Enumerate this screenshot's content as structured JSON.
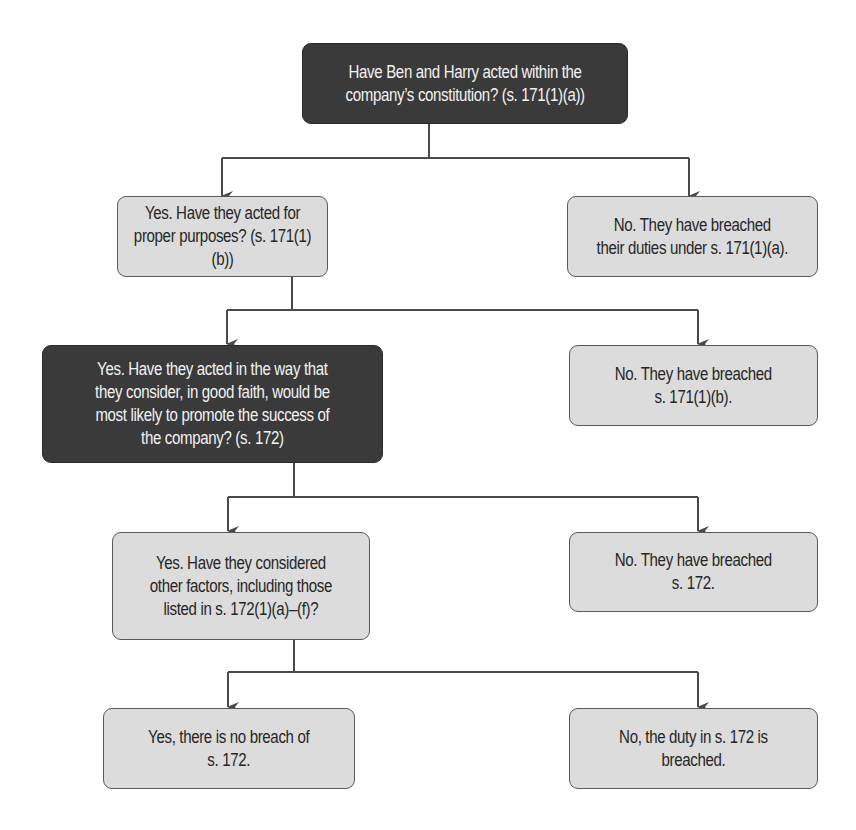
{
  "diagram": {
    "type": "flowchart",
    "line_color": "#4a4a4a",
    "dark_box_color": "#3a3a3a",
    "light_box_color": "#dcdcdc",
    "nodes": {
      "q1": {
        "text": "Have Ben and Harry acted within the\ncompany’s constitution? (s. 171(1)(a))",
        "style": "dark"
      },
      "q1_no": {
        "text": "No. They have breached\ntheir duties under s. 171(1)(a).",
        "style": "light"
      },
      "q2": {
        "text": "Yes. Have they acted for\nproper purposes? (s. 171(1)(b))",
        "style": "light"
      },
      "q2_no": {
        "text": "No. They have breached\ns. 171(1)(b).",
        "style": "light"
      },
      "q3": {
        "text": "Yes. Have they acted in the way that\nthey consider, in good faith, would be\nmost likely to promote the success of\nthe company? (s. 172)",
        "style": "dark"
      },
      "q3_no": {
        "text": "No. They have breached\ns. 172.",
        "style": "light"
      },
      "q4": {
        "text": "Yes. Have they considered\nother factors, including those\nlisted in s. 172(1)(a)–(f)?",
        "style": "light"
      },
      "q4_yes": {
        "text": "Yes, there is no breach of\ns. 172.",
        "style": "light"
      },
      "q4_no": {
        "text": "No, the duty in  s. 172 is\nbreached.",
        "style": "light"
      }
    },
    "edges": [
      {
        "from": "q1",
        "to": "q2",
        "label": "Yes"
      },
      {
        "from": "q1",
        "to": "q1_no",
        "label": "No"
      },
      {
        "from": "q2",
        "to": "q3",
        "label": "Yes"
      },
      {
        "from": "q2",
        "to": "q2_no",
        "label": "No"
      },
      {
        "from": "q3",
        "to": "q4",
        "label": "Yes"
      },
      {
        "from": "q3",
        "to": "q3_no",
        "label": "No"
      },
      {
        "from": "q4",
        "to": "q4_yes",
        "label": "Yes"
      },
      {
        "from": "q4",
        "to": "q4_no",
        "label": "No"
      }
    ]
  }
}
